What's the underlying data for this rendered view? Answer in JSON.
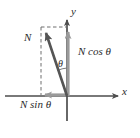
{
  "figure": {
    "kind": "vector-decomposition-diagram",
    "background_color": "#ffffff",
    "width": 140,
    "height": 138
  },
  "colors": {
    "axis": "#4d4d4d",
    "vector": "#555555",
    "component_arrow": "#9a9a9a",
    "dashed_guide": "#6e6e6e",
    "text": "#2b2b2b"
  },
  "axes": {
    "x_label": "x",
    "y_label": "y",
    "origin": {
      "x": 67,
      "y": 96
    }
  },
  "vectors": {
    "resultant": {
      "label": "N",
      "tail": {
        "x": 67,
        "y": 96
      },
      "tip": {
        "x": 43,
        "y": 28
      },
      "style": "solid-thick-arrow"
    },
    "vertical_component": {
      "label": "N cos θ",
      "tail": {
        "x": 68,
        "y": 96
      },
      "tip": {
        "x": 68,
        "y": 28
      },
      "style": "gray-arrow"
    },
    "horizontal_component": {
      "label": "N sin θ",
      "tail": {
        "x": 66,
        "y": 95
      },
      "tip": {
        "x": 40,
        "y": 95
      },
      "style": "gray-arrow"
    }
  },
  "angle": {
    "label": "θ",
    "between": [
      "resultant",
      "y-axis"
    ],
    "arc_radius": 28
  },
  "guides": [
    {
      "name": "vertical-dashed-guide",
      "from": {
        "x": 41,
        "y": 27
      },
      "to": {
        "x": 41,
        "y": 95
      }
    },
    {
      "name": "horizontal-dashed-guide",
      "from": {
        "x": 41,
        "y": 27
      },
      "to": {
        "x": 68,
        "y": 27
      }
    }
  ]
}
